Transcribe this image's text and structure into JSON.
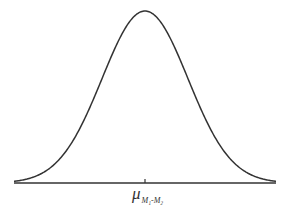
{
  "figure": {
    "title": "",
    "curve_color": "#333333",
    "axis_color": "#333333"
  },
  "axis": {
    "center_label_main": "μ",
    "center_label_sub": "M₁-M₂"
  },
  "chart_data": {
    "type": "line",
    "title": "",
    "xlabel": "",
    "ylabel": "",
    "distribution": "normal",
    "center_tick_label": "μ_{M₁-M₂}",
    "x": [
      -3,
      -2.5,
      -2,
      -1.5,
      -1,
      -0.5,
      0,
      0.5,
      1,
      1.5,
      2,
      2.5,
      3
    ],
    "values": [
      0.004,
      0.018,
      0.054,
      0.13,
      0.242,
      0.352,
      0.399,
      0.352,
      0.242,
      0.13,
      0.054,
      0.018,
      0.004
    ],
    "grid": false,
    "legend": null
  }
}
